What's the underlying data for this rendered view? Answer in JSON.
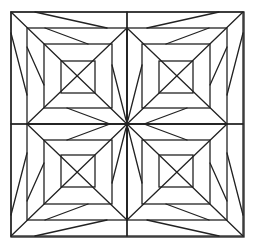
{
  "diagram": {
    "type": "geometric-pattern",
    "stroke_color": "#222222",
    "background_color": "#ffffff",
    "outer_square": {
      "x1": 11,
      "y1": 12,
      "x2": 244,
      "y2": 237
    },
    "center": {
      "x": 127,
      "y": 124
    },
    "quadrant_template": {
      "squares": [
        {
          "x1": 11,
          "y1": 12,
          "x2": 127,
          "y2": 124
        },
        {
          "x1": 27,
          "y1": 28,
          "x2": 127,
          "y2": 124
        },
        {
          "x1": 44,
          "y1": 44,
          "x2": 112,
          "y2": 108
        },
        {
          "x1": 61,
          "y1": 61,
          "x2": 95,
          "y2": 93
        }
      ],
      "lines": [
        {
          "x1": 11,
          "y1": 12,
          "x2": 127,
          "y2": 124
        },
        {
          "x1": 127,
          "y1": 28,
          "x2": 27,
          "y2": 124
        },
        {
          "x1": 35,
          "y1": 12,
          "x2": 107,
          "y2": 28
        },
        {
          "x1": 11,
          "y1": 33,
          "x2": 27,
          "y2": 95
        },
        {
          "x1": 45,
          "y1": 28,
          "x2": 88,
          "y2": 44
        },
        {
          "x1": 27,
          "y1": 47,
          "x2": 44,
          "y2": 85
        },
        {
          "x1": 67,
          "y1": 108,
          "x2": 110,
          "y2": 124
        },
        {
          "x1": 112,
          "y1": 65,
          "x2": 126,
          "y2": 120
        }
      ]
    },
    "quadrants": [
      {
        "name": "top-left",
        "mirror_x": false,
        "mirror_y": false
      },
      {
        "name": "top-right",
        "mirror_x": true,
        "mirror_y": false
      },
      {
        "name": "bottom-left",
        "mirror_x": false,
        "mirror_y": true
      },
      {
        "name": "bottom-right",
        "mirror_x": true,
        "mirror_y": true
      }
    ]
  }
}
